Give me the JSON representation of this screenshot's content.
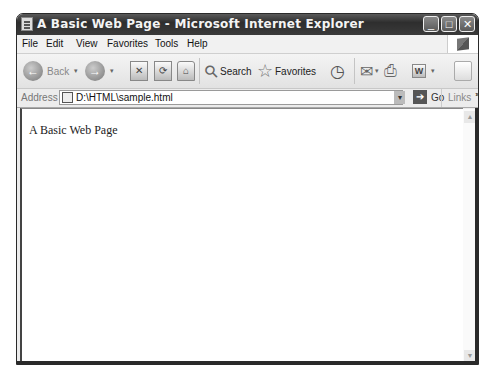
{
  "window": {
    "title": "A Basic Web Page - Microsoft Internet Explorer",
    "controls": {
      "minimize": "_",
      "maximize": "□",
      "close": "✕"
    }
  },
  "menubar": {
    "items": [
      {
        "label": "File"
      },
      {
        "label": "Edit"
      },
      {
        "label": "View"
      },
      {
        "label": "Favorites"
      },
      {
        "label": "Tools"
      },
      {
        "label": "Help"
      }
    ]
  },
  "toolbar": {
    "back_label": "Back",
    "back_icon": "←",
    "forward_icon": "→",
    "stop_icon": "✕",
    "refresh_icon": "⟳",
    "home_icon": "⌂",
    "search_label": "Search",
    "search_icon": "⚲",
    "favorites_label": "Favorites",
    "favorites_icon": "☆",
    "history_icon": "◷",
    "mail_icon": "✉",
    "print_icon": "⎙",
    "word_icon": "W",
    "dropdown": "▾"
  },
  "addressbar": {
    "label": "Address",
    "value": "D:\\HTML\\sample.html",
    "go_label": "Go",
    "go_icon": "➔",
    "links_label": "Links",
    "links_more": "»",
    "dropdown": "▾"
  },
  "content": {
    "text": "A Basic Web Page"
  },
  "scrollbar": {
    "up": "▲",
    "down": "▼"
  }
}
